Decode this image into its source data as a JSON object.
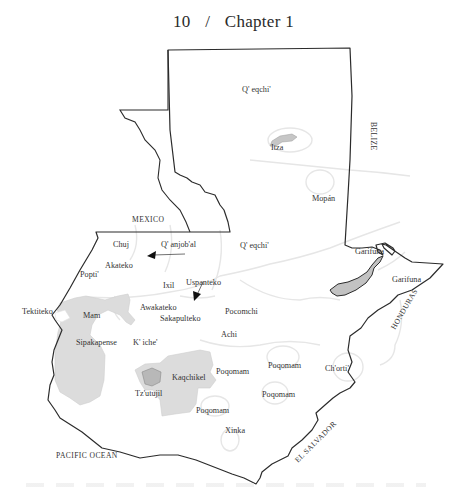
{
  "header": {
    "page_number": "10",
    "separator": "/",
    "chapter": "Chapter 1"
  },
  "map": {
    "colors": {
      "border": "#2b2b2b",
      "region_line": "#e6e6e6",
      "shaded_region": "#d9d9d9",
      "dark_shaded": "#bdbdbd",
      "label": "#333333"
    },
    "countries": {
      "mexico": "MEXICO",
      "belize": "BELIZE",
      "honduras": "HONDURAS",
      "el_salvador": "EL SALVADOR",
      "pacific": "PACIFIC OCEAN"
    },
    "languages": {
      "qeqchi_north": "Q' eqchi'",
      "itza": "Itza",
      "mopan": "Mopán",
      "qeqchi_central": "Q' eqchi'",
      "garifuna_1": "Garifuna",
      "garifuna_2": "Garifuna",
      "chuj": "Chuj",
      "qanjobal": "Q' anjob'al",
      "akateko": "Akateko",
      "popti": "Popti'",
      "ixil": "Ixil",
      "uspanteko": "Uspanteko",
      "tektiteko": "Tektiteko",
      "mam": "Mam",
      "awakateko": "Awakateko",
      "sakapulteko": "Sakapulteko",
      "pocomchi": "Pocomchi",
      "sipakapense": "Sipakapense",
      "kiche": "K' iche'",
      "achi": "Achi",
      "kaqchikel": "Kaqchikel",
      "tzutujil": "Tz'utujil",
      "poqomam_1": "Poqomam",
      "poqomam_2": "Poqomam",
      "poqomam_3": "Poqomam",
      "poqomam_4": "Poqomam",
      "chorti": "Ch'orti'",
      "xinka": "Xinka"
    }
  }
}
